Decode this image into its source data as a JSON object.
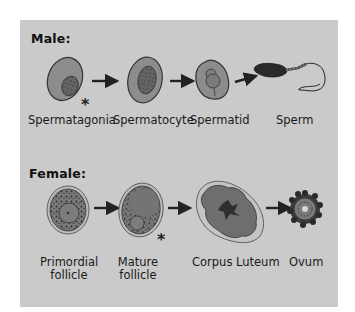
{
  "male": {
    "title": "Male:",
    "stages": [
      {
        "label": "Spermatagonia",
        "marked": true
      },
      {
        "label": "Spermatocyte",
        "marked": false
      },
      {
        "label": "Spermatid",
        "marked": false
      },
      {
        "label": "Sperm",
        "marked": false
      }
    ]
  },
  "female": {
    "title": "Female:",
    "stages": [
      {
        "label_line1": "Primordial",
        "label_line2": "follicle",
        "marked": false
      },
      {
        "label_line1": "Mature",
        "label_line2": "follicle",
        "marked": true
      },
      {
        "label_line1": "Corpus Luteum",
        "label_line2": "",
        "marked": false
      },
      {
        "label_line1": "Ovum",
        "label_line2": "",
        "marked": false
      }
    ]
  },
  "marker_symbol": "*",
  "colors": {
    "panel": "#cacaca",
    "cell_fill": "#8a8a8a",
    "cell_outline": "#3a3a3a",
    "nucleus": "#5a5a5a",
    "text": "#111111"
  }
}
